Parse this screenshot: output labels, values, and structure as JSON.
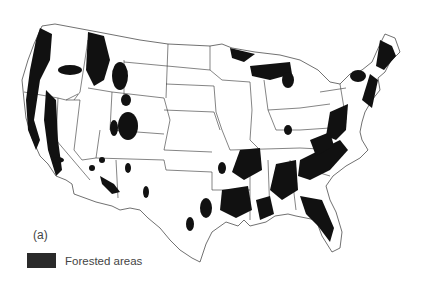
{
  "figure": {
    "panel_label": "(a)"
  },
  "legend": {
    "items": [
      {
        "label": "Forested areas",
        "color": "#2a2a2a"
      }
    ]
  },
  "colors": {
    "forest": "#111111",
    "background": "#ffffff",
    "borders": "#333333"
  }
}
